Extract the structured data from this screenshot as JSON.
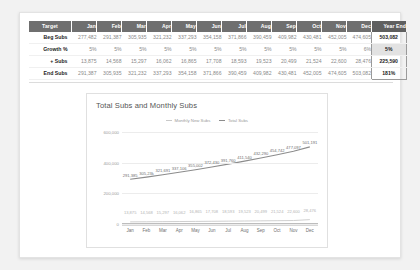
{
  "table": {
    "headers": [
      "Target",
      "Jan",
      "Feb",
      "Mar",
      "Apr",
      "May",
      "Jun",
      "Jul",
      "Aug",
      "Sep",
      "Oct",
      "Nov",
      "Dec",
      "Year End"
    ],
    "rows": [
      {
        "label": "Beg Subs",
        "values": [
          "277,482",
          "291,387",
          "305,935",
          "321,232",
          "337,293",
          "354,158",
          "371,866",
          "390,459",
          "409,982",
          "430,481",
          "452,005",
          "474,605"
        ],
        "year_end": "503,082"
      },
      {
        "label": "Growth %",
        "values": [
          "5%",
          "5%",
          "5%",
          "5%",
          "5%",
          "5%",
          "5%",
          "5%",
          "5%",
          "5%",
          "5%",
          "6%"
        ],
        "year_end": "5%"
      },
      {
        "label": "+ Subs",
        "values": [
          "13,875",
          "14,568",
          "15,297",
          "16,062",
          "16,865",
          "17,708",
          "18,593",
          "19,523",
          "20,499",
          "21,524",
          "22,600",
          "28,476"
        ],
        "year_end": "225,590"
      },
      {
        "label": "End Subs",
        "values": [
          "291,387",
          "305,935",
          "321,232",
          "337,293",
          "354,158",
          "371,866",
          "390,459",
          "409,982",
          "430,481",
          "452,005",
          "474,605",
          "503,082"
        ],
        "year_end": "181%"
      }
    ]
  },
  "chart_data": {
    "type": "line",
    "title": "Total Subs and Monthly Subs",
    "xlabel": "",
    "ylabel": "",
    "categories": [
      "Jan",
      "Feb",
      "Mar",
      "Apr",
      "May",
      "Jun",
      "Jul",
      "Aug",
      "Sep",
      "Oct",
      "Nov",
      "Dec"
    ],
    "yticks": [
      "0",
      "200,000",
      "400,000",
      "600,000"
    ],
    "ylim": [
      0,
      600000
    ],
    "grid": true,
    "legend_position": "top-center",
    "series": [
      {
        "name": "Monthly New Subs",
        "color": "#c9c9c9",
        "values": [
          13875,
          14568,
          15297,
          16062,
          16865,
          17708,
          18593,
          19523,
          20499,
          21524,
          22600,
          28476
        ],
        "labels": [
          "13,875",
          "14,568",
          "15,297",
          "16,062",
          "16,865",
          "17,708",
          "18,593",
          "19,523",
          "20,499",
          "21,524",
          "22,600",
          "28,476"
        ]
      },
      {
        "name": "Total Subs",
        "color": "#8c8c8c",
        "values": [
          291387,
          305935,
          321232,
          337293,
          354158,
          371866,
          390459,
          409982,
          430481,
          452005,
          474605,
          503082
        ],
        "labels": [
          "291,385",
          "305,23k",
          "321,691",
          "337,106",
          "355,002",
          "372,430",
          "391,760",
          "411,540",
          "432,290",
          "454,742",
          "477,097",
          "501,191"
        ]
      }
    ]
  }
}
